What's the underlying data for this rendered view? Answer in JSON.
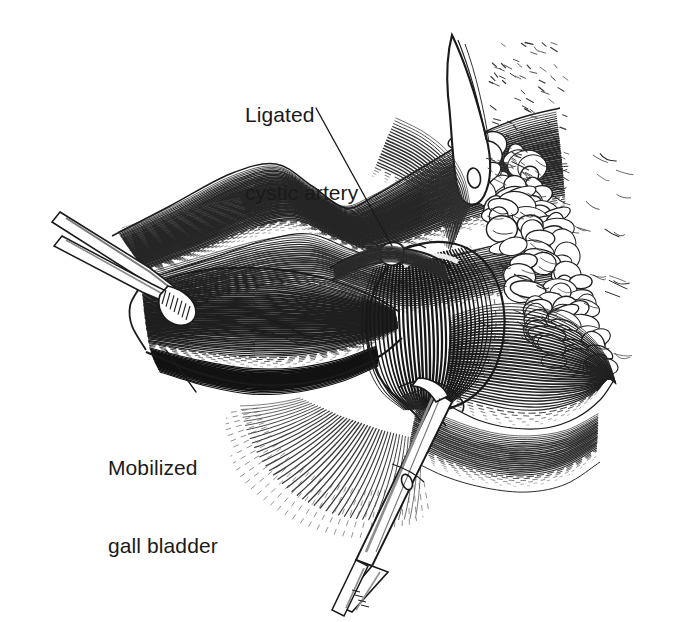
{
  "figure": {
    "type": "medical-line-illustration",
    "technique": "pen-and-ink contour hatching",
    "background_color": "#ffffff",
    "ink_color": "#1a1a1a",
    "width": 674,
    "height": 622
  },
  "labels": [
    {
      "name": "ligated-cystic-artery",
      "line1": "Ligated",
      "line2": "cystic artery",
      "x": 245,
      "y": 50,
      "leader": {
        "x1": 316,
        "y1": 108,
        "x2": 392,
        "y2": 246
      }
    },
    {
      "name": "mobilized-gall-bladder",
      "line1": "Mobilized",
      "line2": "gall bladder",
      "x": 108,
      "y": 403,
      "leader": {
        "x1": 196,
        "y1": 392,
        "x2": 166,
        "y2": 350
      }
    }
  ],
  "anatomy": {
    "liver": {
      "name": "liver-inferior-surface",
      "hatch_color": "#262626",
      "hatch_spacing": 5.0,
      "description": "Undersurface of liver with undulating contour-line hatching, upper left to upper right"
    },
    "gall_bladder_body": {
      "name": "gall-bladder-body",
      "hatch_color": "#1f1f1f",
      "hatch_spacing": 5.2,
      "description": "Elongated mobilized gall bladder body running left-to-right across centre, grasped by forceps at its fundus"
    },
    "gall_bladder_fundus": {
      "name": "gall-bladder-infundibulum",
      "hatch_color": "#161616",
      "hatch_spacing": 4.6,
      "description": "Rounded distended infundibulum / Hartmann's pouch at centre right"
    },
    "cystic_artery": {
      "name": "cystic-artery",
      "description": "Ligated vessel arching over the cystic duct with a ligature knot"
    },
    "cystic_duct": {
      "name": "cystic-duct",
      "description": "Duct passing beneath the infundibulum toward the instrument"
    },
    "omental_fat": {
      "name": "omental-fat-lobules",
      "description": "Lobular fatty tissue along right margin with nodular outlines"
    },
    "duodenum": {
      "name": "duodenum-and-hepatoduodenal-tissue",
      "description": "Rounded structure lower right with radiating hatch"
    },
    "falciform_edge": {
      "name": "falciform-ligament-edge",
      "description": "Sharp curved ridge top right above fatty tissue"
    }
  },
  "instruments": [
    {
      "name": "grasping-forceps-left",
      "description": "Slim two-tined grasping forceps entering from upper left, holding gall bladder neck",
      "tip_x": 170,
      "tip_y": 285
    },
    {
      "name": "hemostat-clamp-bottom",
      "description": "Curved hemostat clamp entering from lower right, clamping the cystic duct",
      "tip_x": 430,
      "tip_y": 390
    }
  ],
  "hatching": {
    "liver_bands": 46,
    "gall_bladder_bands": 52,
    "fundus_bands": 34,
    "duodenum_bands": 40,
    "fat_lobules": 46
  }
}
